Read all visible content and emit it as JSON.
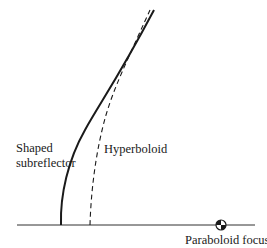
{
  "diagram": {
    "labels": {
      "shaped_line1": "Shaped",
      "shaped_line2": "subreflector",
      "hyperboloid": "Hyperboloid",
      "paraboloid_focus": "Paraboloid focus"
    },
    "colors": {
      "ink": "#1a1a1a",
      "background": "#ffffff"
    },
    "curves": [
      {
        "name": "shaped-subreflector",
        "style": "solid"
      },
      {
        "name": "hyperboloid",
        "style": "dashed"
      }
    ],
    "markers": [
      {
        "name": "paraboloid-focus",
        "symbol": "quartered-circle"
      }
    ]
  }
}
